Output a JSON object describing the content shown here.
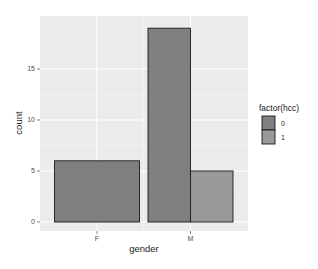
{
  "chart_data": {
    "type": "bar",
    "title": "",
    "xlabel": "gender",
    "ylabel": "count",
    "categories": [
      "F",
      "M"
    ],
    "series": [
      {
        "name": "0",
        "values": [
          6,
          19
        ]
      },
      {
        "name": "1",
        "values": [
          0,
          5
        ]
      }
    ],
    "bars": [
      {
        "category": "F",
        "group": "0",
        "value": 6
      },
      {
        "category": "M",
        "group": "0",
        "value": 19
      },
      {
        "category": "M",
        "group": "1",
        "value": 5
      }
    ],
    "position": "dodge",
    "ylim": [
      0,
      20
    ],
    "yticks": [
      0,
      5,
      10,
      15
    ],
    "grid": true,
    "legend": {
      "title": "factor(hcc)",
      "position": "right",
      "entries": [
        {
          "label": "0",
          "color": "#7f7f7f"
        },
        {
          "label": "1",
          "color": "#999999"
        }
      ]
    }
  },
  "colors": {
    "panel_bg": "#ebebeb",
    "grid_major": "#ffffff",
    "grid_minor": "#f5f5f5",
    "bar_outline": "#1a1a1a",
    "group_0": "#7f7f7f",
    "group_1": "#999999"
  }
}
